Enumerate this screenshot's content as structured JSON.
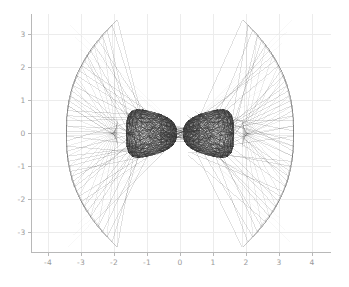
{
  "figure": {
    "background_color": "#ffffff",
    "width": 349,
    "height": 287
  },
  "chart_data": {
    "type": "line",
    "title": "",
    "subtitle": "",
    "xlabel": "",
    "ylabel": "",
    "xlim": [
      -4.6,
      4.6
    ],
    "ylim": [
      -3.75,
      3.75
    ],
    "grid": true,
    "grid_color": "#ececec",
    "axis_color": "#b8b8b8",
    "tick_label_color": "#9a9a9a",
    "legend": null,
    "legend_position": "none",
    "annotations": [],
    "xticks": [
      -4,
      -3,
      -2,
      -1,
      0,
      1,
      2,
      3,
      4
    ],
    "xtick_labels": [
      "-4",
      "-3",
      "-2",
      "-1",
      "0",
      "1",
      "2",
      "3",
      "4"
    ],
    "yticks": [
      3,
      2,
      1,
      0,
      -1,
      -2,
      -3
    ],
    "ytick_labels": [
      "3",
      "2",
      "1",
      "0",
      "-1",
      "-2",
      "-3"
    ],
    "series": [
      {
        "name": "core-bowtie",
        "description": "dense dark hourglass of segments near the origin",
        "color": "#333333",
        "opacity": 0.3,
        "line_width": 0.7,
        "node_count": 64,
        "x_extent": [
          -1.55,
          1.55
        ],
        "y_extent": [
          -0.82,
          0.82
        ],
        "waist_x": 0.0,
        "waist_half_height": 0.3
      },
      {
        "name": "left-wing-fan",
        "description": "fan of segments from core waist out to curved left boundary",
        "color": "#444444",
        "opacity": 0.34,
        "line_width": 0.55,
        "node_count": 46,
        "x_extent": [
          -3.45,
          -1.85
        ],
        "y_extent": [
          -3.45,
          3.45
        ]
      },
      {
        "name": "right-wing-fan",
        "description": "mirrored fan of segments from core waist out to curved right boundary",
        "color": "#444444",
        "opacity": 0.34,
        "line_width": 0.55,
        "node_count": 46,
        "x_extent": [
          1.85,
          3.45
        ],
        "y_extent": [
          -3.45,
          3.45
        ]
      },
      {
        "name": "pale-center-rays",
        "description": "very faint rays converging at the origin waist",
        "color": "#bcbcbc",
        "opacity": 0.22,
        "line_width": 0.5,
        "node_count": 40
      }
    ]
  }
}
